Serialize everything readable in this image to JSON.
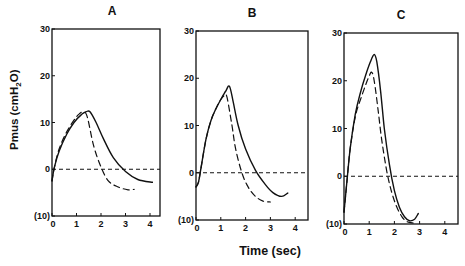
{
  "figure": {
    "ylabel_main": "Pmus (cmH",
    "ylabel_sub": "2",
    "ylabel_end": "O)",
    "xlabel": "Time (sec)"
  },
  "chart_data": {
    "type": "line",
    "ylabel": "Pmus (cmH2O)",
    "xlabel": "Time (sec)",
    "panels": [
      {
        "title": "A",
        "xlim": [
          0,
          4.4
        ],
        "ylim": [
          -10,
          30
        ],
        "xticks": [
          "0",
          "1",
          "2",
          "3",
          "4"
        ],
        "yticks": [
          {
            "v": 30,
            "label": "30"
          },
          {
            "v": 20,
            "label": "20"
          },
          {
            "v": 10,
            "label": "10"
          },
          {
            "v": 0,
            "label": "0"
          },
          {
            "v": -10,
            "label": "(10)"
          }
        ],
        "frame_px": {
          "left": 52,
          "top": 29,
          "right": 160,
          "bottom": 216,
          "x_unit": 24.5
        },
        "baseline": {
          "y": 0,
          "style": "dashed"
        },
        "series": [
          {
            "name": "solid",
            "style": "solid",
            "x": [
              0.0,
              0.1,
              0.3,
              0.6,
              0.9,
              1.2,
              1.4,
              1.55,
              1.8,
              2.1,
              2.5,
              3.0,
              3.5,
              4.1
            ],
            "y": [
              -2.5,
              0.5,
              4,
              7.5,
              10,
              11.7,
              12.3,
              12.3,
              10,
              6.5,
              2.5,
              -0.5,
              -2.2,
              -2.8
            ]
          },
          {
            "name": "dashed",
            "style": "dashed",
            "x": [
              0.0,
              0.1,
              0.3,
              0.6,
              0.9,
              1.1,
              1.3,
              1.45,
              1.7,
              2.0,
              2.3,
              2.7,
              3.1,
              3.35
            ],
            "y": [
              -2.5,
              0.5,
              4.5,
              8,
              10.5,
              11.8,
              12.3,
              11,
              5,
              0.5,
              -2.5,
              -3.8,
              -4.4,
              -4.3
            ]
          }
        ]
      },
      {
        "title": "B",
        "xlim": [
          0,
          4.4
        ],
        "ylim": [
          -10,
          30
        ],
        "xticks": [
          "0",
          "1",
          "2",
          "3",
          "4"
        ],
        "yticks": [
          {
            "v": 30,
            "label": "30"
          },
          {
            "v": 20,
            "label": "20"
          },
          {
            "v": 10,
            "label": "10"
          },
          {
            "v": 0,
            "label": "0"
          },
          {
            "v": -10,
            "label": "(10)"
          }
        ],
        "frame_px": {
          "left": 196,
          "top": 31,
          "right": 308,
          "bottom": 220,
          "x_unit": 24.8
        },
        "baseline": {
          "y": 0,
          "style": "dashed"
        },
        "series": [
          {
            "name": "solid",
            "style": "solid",
            "x": [
              0.0,
              0.1,
              0.2,
              0.4,
              0.6,
              0.8,
              1.0,
              1.2,
              1.35,
              1.5,
              1.7,
              2.0,
              2.4,
              2.8,
              3.1,
              3.45,
              3.7
            ],
            "y": [
              -3,
              -2,
              1,
              7,
              11,
              13.5,
              15.5,
              17.3,
              18.3,
              15,
              10,
              5,
              0.5,
              -2.5,
              -4.2,
              -5,
              -4.3
            ]
          },
          {
            "name": "dashed",
            "style": "dashed",
            "x": [
              0.0,
              0.1,
              0.2,
              0.4,
              0.6,
              0.8,
              1.0,
              1.15,
              1.25,
              1.45,
              1.6,
              1.85,
              2.1,
              2.4,
              2.7,
              3.0
            ],
            "y": [
              -3,
              -2,
              1,
              7,
              11,
              13.5,
              15.5,
              16.3,
              16,
              10,
              5,
              0,
              -3,
              -5,
              -6,
              -6.2
            ]
          }
        ]
      },
      {
        "title": "C",
        "xlim": [
          0,
          4.5
        ],
        "ylim": [
          -10,
          30
        ],
        "xticks": [
          "0",
          "1",
          "2",
          "3",
          "4"
        ],
        "yticks": [
          {
            "v": 30,
            "label": "30"
          },
          {
            "v": 20,
            "label": "20"
          },
          {
            "v": 10,
            "label": "10"
          },
          {
            "v": 0,
            "label": "0"
          },
          {
            "v": -10,
            "label": "(10)"
          }
        ],
        "frame_px": {
          "left": 344,
          "top": 33,
          "right": 458,
          "bottom": 224,
          "x_unit": 25.2
        },
        "baseline": {
          "y": 0,
          "style": "dashed"
        },
        "series": [
          {
            "name": "solid",
            "style": "solid",
            "x": [
              0.0,
              0.1,
              0.25,
              0.45,
              0.65,
              0.85,
              1.05,
              1.2,
              1.3,
              1.45,
              1.6,
              1.8,
              2.0,
              2.2,
              2.4,
              2.6,
              2.8,
              2.95
            ],
            "y": [
              -7.5,
              -2,
              6,
              13,
              17.5,
              21,
              24,
              25.5,
              24,
              18,
              10,
              2.5,
              -3,
              -6.5,
              -8.5,
              -9.3,
              -9,
              -7.8
            ]
          },
          {
            "name": "dashed",
            "style": "dashed",
            "x": [
              0.0,
              0.1,
              0.25,
              0.45,
              0.65,
              0.85,
              1.0,
              1.1,
              1.2,
              1.35,
              1.5,
              1.7,
              1.9,
              2.1,
              2.3,
              2.5,
              2.75
            ],
            "y": [
              -7.5,
              -2,
              6,
              12.5,
              16,
              19,
              21,
              21.8,
              20,
              14,
              7.5,
              1,
              -3.5,
              -6.5,
              -8.5,
              -9.5,
              -9.8
            ]
          }
        ]
      }
    ]
  }
}
